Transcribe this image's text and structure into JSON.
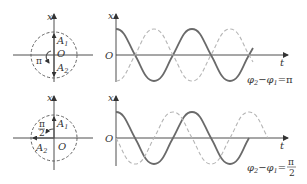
{
  "diagram": {
    "panels": [
      {
        "phasor": {
          "axis_label": "x",
          "origin_label": "O",
          "vector1_label": "A",
          "vector1_sub": "1",
          "vector2_label": "A",
          "vector2_sub": "2",
          "angle_label": "π"
        },
        "graph": {
          "y_axis_label": "x",
          "x_axis_label": "t",
          "origin_label": "O",
          "solid_curve": "x1 = A cos(ωt)",
          "dashed_curve": "x2 = A cos(ωt + π)",
          "phase_formula_lhs": "φ",
          "phase_formula_sub2": "2",
          "phase_formula_minus": "−",
          "phase_formula_sub1": "1",
          "phase_formula_rhs": "=π"
        }
      },
      {
        "phasor": {
          "axis_label": "x",
          "origin_label": "O",
          "vector1_label": "A",
          "vector1_sub": "1",
          "vector2_label": "A",
          "vector2_sub": "2",
          "angle_num": "π",
          "angle_den": "2"
        },
        "graph": {
          "y_axis_label": "x",
          "x_axis_label": "t",
          "origin_label": "O",
          "solid_curve": "x1 = A cos(ωt)",
          "dashed_curve": "x2 = A cos(ωt + π/2)",
          "phase_formula_lhs": "φ",
          "phase_formula_sub2": "2",
          "phase_formula_minus": "−",
          "phase_formula_sub1": "1",
          "phase_formula_eq": "=",
          "phase_formula_num": "π",
          "phase_formula_den": "2"
        }
      }
    ]
  }
}
